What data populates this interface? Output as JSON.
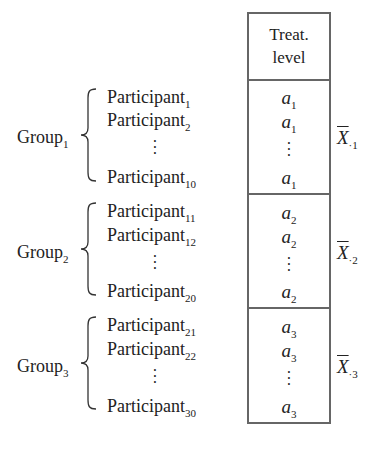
{
  "header": {
    "line1": "Treat.",
    "line2": "level"
  },
  "groups": [
    {
      "label": "Group",
      "label_sub": "1",
      "participants": [
        {
          "name": "Participant",
          "sub": "1"
        },
        {
          "name": "Participant",
          "sub": "2"
        },
        {
          "name": "Participant",
          "sub": "10"
        }
      ],
      "levels": [
        {
          "name": "a",
          "sub": "1"
        },
        {
          "name": "a",
          "sub": "1"
        },
        {
          "name": "a",
          "sub": "1"
        }
      ],
      "mean": {
        "symbol": "X",
        "sub": "·1"
      }
    },
    {
      "label": "Group",
      "label_sub": "2",
      "participants": [
        {
          "name": "Participant",
          "sub": "11"
        },
        {
          "name": "Participant",
          "sub": "12"
        },
        {
          "name": "Participant",
          "sub": "20"
        }
      ],
      "levels": [
        {
          "name": "a",
          "sub": "2"
        },
        {
          "name": "a",
          "sub": "2"
        },
        {
          "name": "a",
          "sub": "2"
        }
      ],
      "mean": {
        "symbol": "X",
        "sub": "·2"
      }
    },
    {
      "label": "Group",
      "label_sub": "3",
      "participants": [
        {
          "name": "Participant",
          "sub": "21"
        },
        {
          "name": "Participant",
          "sub": "22"
        },
        {
          "name": "Participant",
          "sub": "30"
        }
      ],
      "levels": [
        {
          "name": "a",
          "sub": "3"
        },
        {
          "name": "a",
          "sub": "3"
        },
        {
          "name": "a",
          "sub": "3"
        }
      ],
      "mean": {
        "symbol": "X",
        "sub": "·3"
      }
    }
  ],
  "ellipsis": "⋮"
}
